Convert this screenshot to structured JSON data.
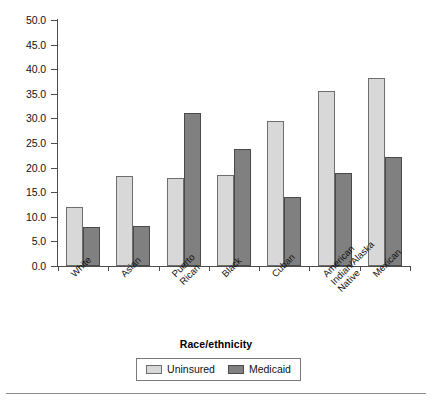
{
  "chart_data": {
    "type": "bar",
    "title": "",
    "xlabel": "Race/ethnicity",
    "ylabel": "",
    "ylim": [
      0.0,
      50.0
    ],
    "ytick_step": 5.0,
    "grid": false,
    "legend_position": "bottom-center",
    "categories": [
      "White",
      "Asian",
      "Puerto Rican",
      "Black",
      "Cuban",
      "American Indian/Alaska Native",
      "Mexican"
    ],
    "category_lines": [
      [
        "White"
      ],
      [
        "Asian"
      ],
      [
        "Puerto",
        "Rican"
      ],
      [
        "Black"
      ],
      [
        "Cuban"
      ],
      [
        "American",
        "Indian/Alaska",
        "Native"
      ],
      [
        "Mexican"
      ]
    ],
    "ytick_labels": [
      "50.0",
      "45.0",
      "40.0",
      "35.0",
      "30.0",
      "25.0",
      "20.0",
      "15.0",
      "10.0",
      "5.0",
      "0.0"
    ],
    "ytick_values": [
      50.0,
      45.0,
      40.0,
      35.0,
      30.0,
      25.0,
      20.0,
      15.0,
      10.0,
      5.0,
      0.0
    ],
    "series": [
      {
        "name": "Uninsured",
        "color": "#d8d8d8",
        "values": [
          12.0,
          18.3,
          17.8,
          18.4,
          29.4,
          35.5,
          38.3
        ]
      },
      {
        "name": "Medicaid",
        "color": "#808080",
        "values": [
          8.0,
          8.1,
          31.2,
          23.7,
          14.1,
          19.0,
          22.2
        ]
      }
    ]
  },
  "legend": {
    "entries": [
      {
        "label": "Uninsured",
        "swatch": "uninsured"
      },
      {
        "label": "Medicaid",
        "swatch": "medicaid"
      }
    ]
  }
}
